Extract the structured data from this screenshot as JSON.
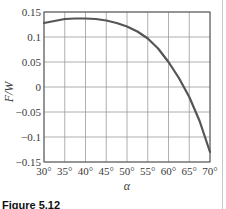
{
  "chart_data": {
    "type": "line",
    "title": "",
    "xlabel": "α",
    "ylabel": "F/W",
    "xlim": [
      30,
      70
    ],
    "ylim": [
      -0.15,
      0.15
    ],
    "grid": true,
    "x_ticks": [
      "30°",
      "35°",
      "40°",
      "45°",
      "50°",
      "55°",
      "60°",
      "65°",
      "70°"
    ],
    "y_ticks": [
      "0.15",
      "0.1",
      "0.05",
      "0",
      "−0.05",
      "−0.1",
      "−0.15"
    ],
    "series": [
      {
        "name": "F/W",
        "color": "#555555",
        "x": [
          30,
          32.5,
          35,
          37.5,
          40,
          42.5,
          45,
          47.5,
          50,
          52.5,
          55,
          57.5,
          60,
          62.5,
          65,
          67.5,
          70
        ],
        "values": [
          0.128,
          0.132,
          0.136,
          0.137,
          0.137,
          0.136,
          0.133,
          0.128,
          0.121,
          0.111,
          0.097,
          0.077,
          0.05,
          0.018,
          -0.02,
          -0.068,
          -0.13
        ]
      }
    ]
  },
  "caption": "Figure 5.12"
}
